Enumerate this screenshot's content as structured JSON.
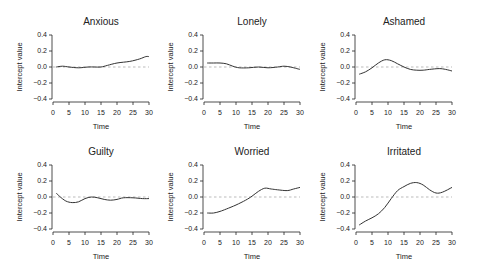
{
  "figure": {
    "xlabel": "Time",
    "ylabel": "Intercept value",
    "x_ticks": [
      0,
      5,
      10,
      15,
      20,
      25,
      30
    ],
    "y_ticks": [
      0.4,
      0.2,
      0.0,
      -0.2,
      -0.4
    ],
    "y_tick_labels": [
      "0.4",
      "0.2",
      "0.0",
      "−0.2",
      "−0.4"
    ],
    "colors": {
      "curve": "#333333",
      "reference_line": "#aaaaaa",
      "axis": "#222222"
    }
  },
  "chart_data": [
    {
      "type": "line",
      "title": "Anxious",
      "xlabel": "Time",
      "ylabel": "Intercept value",
      "xlim": [
        0,
        30
      ],
      "ylim": [
        -0.4,
        0.4
      ],
      "grid": false,
      "reference_line": 0.0,
      "x": [
        1,
        3,
        5,
        8,
        11,
        13,
        15,
        17,
        20,
        24,
        27,
        29,
        30
      ],
      "y": [
        0.0,
        0.01,
        0.0,
        -0.01,
        0.0,
        0.0,
        0.0,
        0.02,
        0.05,
        0.07,
        0.1,
        0.13,
        0.13
      ]
    },
    {
      "type": "line",
      "title": "Lonely",
      "xlabel": "Time",
      "ylabel": "Intercept value",
      "xlim": [
        0,
        30
      ],
      "ylim": [
        -0.4,
        0.4
      ],
      "grid": false,
      "reference_line": 0.0,
      "x": [
        1,
        3,
        5,
        7,
        9,
        11,
        14,
        17,
        20,
        23,
        25,
        27,
        29,
        30
      ],
      "y": [
        0.05,
        0.05,
        0.05,
        0.04,
        0.01,
        -0.01,
        -0.01,
        0.0,
        -0.01,
        0.0,
        0.01,
        0.0,
        -0.02,
        -0.03
      ]
    },
    {
      "type": "line",
      "title": "Ashamed",
      "xlabel": "Time",
      "ylabel": "Intercept value",
      "xlim": [
        0,
        30
      ],
      "ylim": [
        -0.4,
        0.4
      ],
      "grid": false,
      "reference_line": 0.0,
      "x": [
        1,
        3,
        5,
        7,
        9,
        11,
        13,
        15,
        17,
        19,
        21,
        23,
        26,
        28,
        30
      ],
      "y": [
        -0.09,
        -0.06,
        -0.01,
        0.05,
        0.09,
        0.08,
        0.04,
        0.0,
        -0.03,
        -0.04,
        -0.04,
        -0.03,
        -0.02,
        -0.03,
        -0.05
      ]
    },
    {
      "type": "line",
      "title": "Guilty",
      "xlabel": "Time",
      "ylabel": "Intercept value",
      "xlim": [
        0,
        30
      ],
      "ylim": [
        -0.4,
        0.4
      ],
      "grid": false,
      "reference_line": 0.0,
      "x": [
        1,
        2,
        4,
        6,
        8,
        10,
        12,
        14,
        16,
        18,
        20,
        22,
        25,
        28,
        30
      ],
      "y": [
        0.05,
        0.01,
        -0.05,
        -0.07,
        -0.06,
        -0.02,
        0.0,
        -0.01,
        -0.03,
        -0.04,
        -0.03,
        -0.01,
        -0.01,
        -0.02,
        -0.02
      ]
    },
    {
      "type": "line",
      "title": "Worried",
      "xlabel": "Time",
      "ylabel": "Intercept value",
      "xlim": [
        0,
        30
      ],
      "ylim": [
        -0.4,
        0.4
      ],
      "grid": false,
      "reference_line": 0.0,
      "x": [
        1,
        3,
        5,
        7,
        10,
        13,
        15,
        17,
        19,
        21,
        23,
        26,
        28,
        30
      ],
      "y": [
        -0.2,
        -0.2,
        -0.18,
        -0.15,
        -0.1,
        -0.04,
        0.01,
        0.07,
        0.11,
        0.1,
        0.09,
        0.08,
        0.1,
        0.12
      ]
    },
    {
      "type": "line",
      "title": "Irritated",
      "xlabel": "Time",
      "ylabel": "Intercept value",
      "xlim": [
        0,
        30
      ],
      "ylim": [
        -0.4,
        0.4
      ],
      "grid": false,
      "reference_line": 0.0,
      "x": [
        1,
        3,
        5,
        7,
        9,
        11,
        13,
        15,
        17,
        19,
        21,
        23,
        25,
        27,
        30
      ],
      "y": [
        -0.35,
        -0.3,
        -0.26,
        -0.21,
        -0.13,
        -0.02,
        0.08,
        0.13,
        0.17,
        0.18,
        0.15,
        0.09,
        0.05,
        0.06,
        0.12
      ]
    }
  ]
}
